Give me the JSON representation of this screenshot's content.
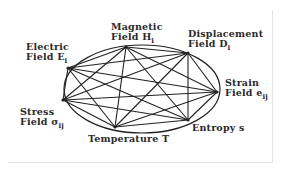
{
  "diagram": {
    "ellipse": {
      "cx": 142,
      "cy": 89,
      "rx": 78,
      "ry": 44
    },
    "nodes": [
      {
        "id": "E",
        "line1": "Electric",
        "line2": "Field E",
        "sub": "i",
        "x": 68,
        "y": 68
      },
      {
        "id": "H",
        "line1": "Magnetic",
        "line2": "Field H",
        "sub": "i",
        "x": 126,
        "y": 47
      },
      {
        "id": "D",
        "line1": "Displacement",
        "line2": "Field D",
        "sub": "i",
        "x": 188,
        "y": 53
      },
      {
        "id": "e",
        "line1": "Strain",
        "line2": "Field e",
        "sub": "ij",
        "x": 217,
        "y": 92
      },
      {
        "id": "s",
        "line1": "Entropy s",
        "line2": "",
        "sub": "",
        "x": 188,
        "y": 120
      },
      {
        "id": "T",
        "line1": "Temperature T",
        "line2": "",
        "sub": "",
        "x": 115,
        "y": 127
      },
      {
        "id": "sigma",
        "line1": "Stress",
        "line2": "Field σ",
        "sub": "ij",
        "x": 63,
        "y": 100
      }
    ],
    "edges": "complete graph: every node connected to every other node",
    "line_color": "#222222"
  }
}
